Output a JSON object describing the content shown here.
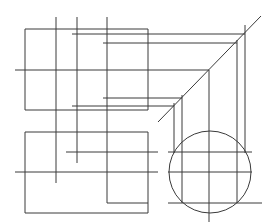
{
  "diagram": {
    "type": "orthographic-projection",
    "stroke_color": "#3a3a3a",
    "background": "#ffffff",
    "rects": [
      {
        "name": "front-view-outline",
        "x": 25,
        "y": 29,
        "w": 123,
        "h": 81
      },
      {
        "name": "top-view-outline",
        "x": 25,
        "y": 132,
        "w": 123,
        "h": 81
      }
    ],
    "circle": {
      "name": "side-view-circle",
      "cx": 210,
      "cy": 172,
      "r": 41
    },
    "lines": [
      {
        "name": "vert-56-top",
        "x1": 56,
        "y1": 17,
        "x2": 56,
        "y2": 110
      },
      {
        "name": "vert-77-top",
        "x1": 77,
        "y1": 17,
        "x2": 77,
        "y2": 110
      },
      {
        "name": "vert-107-top",
        "x1": 107,
        "y1": 17,
        "x2": 107,
        "y2": 110
      },
      {
        "name": "horiz-34",
        "x1": 72,
        "y1": 34,
        "x2": 245,
        "y2": 34
      },
      {
        "name": "horiz-43",
        "x1": 103,
        "y1": 43,
        "x2": 237,
        "y2": 43
      },
      {
        "name": "horiz-70-center",
        "x1": 15,
        "y1": 70,
        "x2": 209,
        "y2": 70
      },
      {
        "name": "horiz-98",
        "x1": 103,
        "y1": 98,
        "x2": 182,
        "y2": 98
      },
      {
        "name": "horiz-106",
        "x1": 72,
        "y1": 106,
        "x2": 174,
        "y2": 106
      },
      {
        "name": "miter-diagonal",
        "x1": 158,
        "y1": 122,
        "x2": 261,
        "y2": 16
      },
      {
        "name": "vert-245-right",
        "x1": 245,
        "y1": 25,
        "x2": 245,
        "y2": 153
      },
      {
        "name": "vert-237-right",
        "x1": 237,
        "y1": 40,
        "x2": 237,
        "y2": 203
      },
      {
        "name": "vert-209-center",
        "x1": 209,
        "y1": 70,
        "x2": 209,
        "y2": 222
      },
      {
        "name": "vert-182-right",
        "x1": 182,
        "y1": 95,
        "x2": 182,
        "y2": 203
      },
      {
        "name": "vert-174-right",
        "x1": 174,
        "y1": 103,
        "x2": 174,
        "y2": 153
      },
      {
        "name": "vert-56-bottom",
        "x1": 56,
        "y1": 110,
        "x2": 56,
        "y2": 183
      },
      {
        "name": "vert-77-bottom",
        "x1": 77,
        "y1": 110,
        "x2": 77,
        "y2": 163
      },
      {
        "name": "vert-107-bottom",
        "x1": 107,
        "y1": 110,
        "x2": 107,
        "y2": 203
      },
      {
        "name": "horiz-152-left",
        "x1": 66,
        "y1": 152,
        "x2": 158,
        "y2": 152
      },
      {
        "name": "horiz-172-left-center",
        "x1": 15,
        "y1": 172,
        "x2": 158,
        "y2": 172
      },
      {
        "name": "horiz-203-left",
        "x1": 107,
        "y1": 203,
        "x2": 148,
        "y2": 203
      },
      {
        "name": "horiz-152-right",
        "x1": 168,
        "y1": 152,
        "x2": 252,
        "y2": 152
      },
      {
        "name": "horiz-172-right-center",
        "x1": 168,
        "y1": 172,
        "x2": 252,
        "y2": 172
      },
      {
        "name": "horiz-203-right",
        "x1": 168,
        "y1": 203,
        "x2": 262,
        "y2": 203
      }
    ]
  }
}
